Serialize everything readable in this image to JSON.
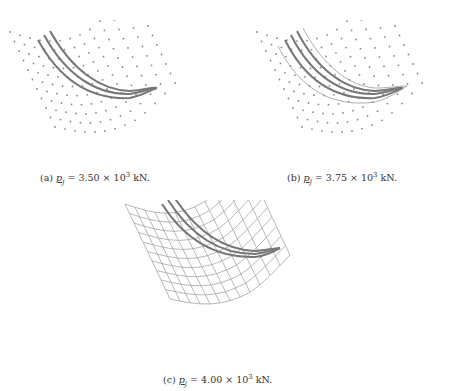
{
  "figure": {
    "panels": [
      {
        "id": "a",
        "label": "(a)",
        "symbol": "p",
        "subscript": "j",
        "equals": "=",
        "value": "3.50",
        "times": "×",
        "base": "10",
        "exponent": "3",
        "unit": "kN."
      },
      {
        "id": "b",
        "label": "(b)",
        "symbol": "p",
        "subscript": "j",
        "equals": "=",
        "value": "3.75",
        "times": "×",
        "base": "10",
        "exponent": "3",
        "unit": "kN."
      },
      {
        "id": "c",
        "label": "(c)",
        "symbol": "p",
        "subscript": "j",
        "equals": "=",
        "value": "4.00",
        "times": "×",
        "base": "10",
        "exponent": "3",
        "unit": "kN."
      }
    ],
    "colors": {
      "curve": "#777777",
      "dots": "#888888",
      "grid": "#999999"
    }
  }
}
